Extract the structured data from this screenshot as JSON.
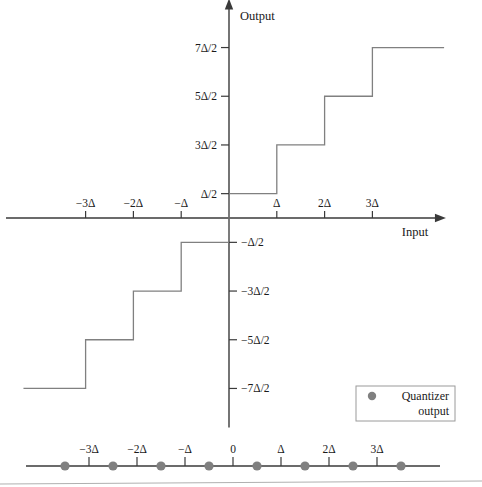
{
  "figure": {
    "colors": {
      "line": "#808080",
      "axis": "#3a3a3a",
      "text": "#1a1a1a",
      "marker": "#808080",
      "legend_border": "#9a9a9a",
      "background": "#ffffff",
      "rule": "#b0b0b0"
    }
  },
  "axes": {
    "x_label": "Input",
    "y_label": "Output",
    "origin": {
      "x": 229,
      "y": 218
    },
    "unit_x": 47.8,
    "unit_y": 48.7,
    "x_range_units": [
      -4.3,
      4.35
    ],
    "y_range_units": [
      -4.3,
      4.3
    ]
  },
  "x_ticks": [
    {
      "label": "−3Δ",
      "value": -3
    },
    {
      "label": "−2Δ",
      "value": -2
    },
    {
      "label": "−Δ",
      "value": -1
    },
    {
      "label": "Δ",
      "value": 1
    },
    {
      "label": "2Δ",
      "value": 2
    },
    {
      "label": "3Δ",
      "value": 3
    }
  ],
  "y_ticks": [
    {
      "label": "7Δ/2",
      "value": 3.5
    },
    {
      "label": "5Δ/2",
      "value": 2.5
    },
    {
      "label": "3Δ/2",
      "value": 1.5
    },
    {
      "label": "Δ/2",
      "value": 0.5
    },
    {
      "label": "−Δ/2",
      "value": -0.5
    },
    {
      "label": "−3Δ/2",
      "value": -1.5
    },
    {
      "label": "−5Δ/2",
      "value": -2.5
    },
    {
      "label": "−7Δ/2",
      "value": -3.5
    }
  ],
  "legend": {
    "marker_name": "quantizer-output-dot",
    "line1": "Quantizer",
    "line2": "output"
  },
  "number_line": {
    "ticks": [
      {
        "label": "−3Δ",
        "value": -3
      },
      {
        "label": "−2Δ",
        "value": -2
      },
      {
        "label": "−Δ",
        "value": -1
      },
      {
        "label": "0",
        "value": 0
      },
      {
        "label": "Δ",
        "value": 1
      },
      {
        "label": "2Δ",
        "value": 2
      },
      {
        "label": "3Δ",
        "value": 3
      }
    ],
    "markers": [
      -3.5,
      -2.5,
      -1.5,
      -0.5,
      0.5,
      1.5,
      2.5,
      3.5
    ],
    "x_start": 26,
    "x_end": 440,
    "y": 466,
    "origin_x": 233,
    "unit_x": 48.0
  },
  "chart_data": {
    "type": "line",
    "xlabel": "Input",
    "ylabel": "Output",
    "steps": [
      {
        "input_from": -4.3,
        "input_to": -3,
        "output": -3.5
      },
      {
        "input_from": -3,
        "input_to": -2,
        "output": -2.5
      },
      {
        "input_from": -2,
        "input_to": -1,
        "output": -1.5
      },
      {
        "input_from": -1,
        "input_to": 0,
        "output": -0.5
      },
      {
        "input_from": 0,
        "input_to": 1,
        "output": 0.5
      },
      {
        "input_from": 1,
        "input_to": 2,
        "output": 1.5
      },
      {
        "input_from": 2,
        "input_to": 3,
        "output": 2.5
      },
      {
        "input_from": 3,
        "input_to": 4.5,
        "output": 3.5
      }
    ],
    "decision_thresholds": [
      -3,
      -2,
      -1,
      0,
      1,
      2,
      3
    ],
    "reconstruction_levels": [
      -3.5,
      -2.5,
      -1.5,
      -0.5,
      0.5,
      1.5,
      2.5,
      3.5
    ],
    "units": "Δ",
    "grid": false,
    "legend_position": "bottom-right"
  }
}
